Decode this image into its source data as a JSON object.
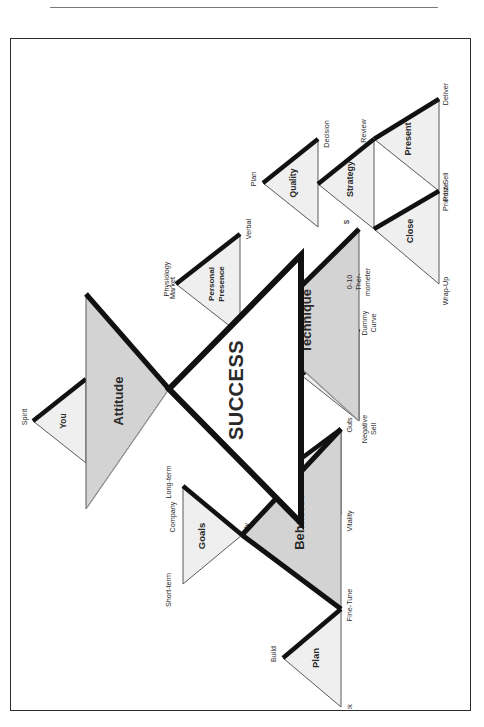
{
  "page": {
    "header_rule": true,
    "frame": {
      "border_color": "#2b2b2b"
    }
  },
  "diagram": {
    "title": "SUCCESS",
    "orientation": "rotated-90-clockwise",
    "fill_light": "#e3e3e3",
    "fill_white": "#ffffff",
    "stroke_dark": "#1a1a1a",
    "stroke_thin": "#4a4a4a",
    "center": {
      "label": "SUCCESS",
      "name": "success-core-triangle"
    },
    "pillars": [
      {
        "id": "attitude",
        "label": "Attitude",
        "corners": [
          "Market",
          "Company"
        ],
        "children": [
          {
            "id": "you",
            "label": "You",
            "corners": [
              "Body",
              "Mind"
            ],
            "grandchildren": [
              "Spirit"
            ]
          }
        ]
      },
      {
        "id": "technique",
        "label": "Technique",
        "corners": [
          "$",
          "0-10 Ther-mometer"
        ],
        "children": [
          {
            "id": "personal-presence",
            "label": "Personal Presence",
            "corners": [
              "Physiology",
              "Verbal",
              "Tonal-ity"
            ]
          },
          {
            "id": "quality",
            "label": "Quality",
            "corners": [
              "Plan",
              "Decision"
            ]
          },
          {
            "id": "strategy",
            "label": "Strategy",
            "corners": [
              "Review"
            ]
          },
          {
            "id": "present",
            "label": "Present",
            "corners": [
              "Deliver",
              "Prioritize"
            ]
          },
          {
            "id": "close",
            "label": "Close",
            "corners": [
              "Post-Sell",
              "Wrap-Up"
            ]
          },
          {
            "id": "tactics",
            "label": "Tactics",
            "corners": [
              "Reversing",
              "Dummy Curve",
              "Negative Sell"
            ]
          }
        ]
      },
      {
        "id": "behavior",
        "label": "Behavior",
        "corners": [
          "Discipline",
          "Build"
        ],
        "children": [
          {
            "id": "goals",
            "label": "Goals",
            "corners": [
              "Long-term",
              "Short-term",
              "Daily"
            ]
          },
          {
            "id": "action",
            "label": "Action",
            "corners": [
              "Guts",
              "Vitality"
            ]
          },
          {
            "id": "plan",
            "label": "Plan",
            "corners": [
              "Fine-Tune",
              "Track"
            ]
          }
        ]
      }
    ],
    "labels": {
      "success": "SUCCESS",
      "attitude": "Attitude",
      "technique": "Technique",
      "behavior": "Behavior",
      "you": "You",
      "spirit": "Spirit",
      "body": "Body",
      "mind": "Mind",
      "market": "Market",
      "company": "Company",
      "personal_presence_l1": "Personal",
      "personal_presence_l2": "Presence",
      "physiology": "Physiology",
      "verbal": "Verbal",
      "tonal_l1": "Tonal-",
      "tonal_l2": "ity",
      "quality": "Quality",
      "plan_top": "Plan",
      "decision": "Decision",
      "strategy": "Strategy",
      "review": "Review",
      "present": "Present",
      "deliver": "Deliver",
      "prioritize": "Prioritize",
      "close": "Close",
      "post_sell": "Post-Sell",
      "wrap_up": "Wrap-Up",
      "dollar": "$",
      "thermo_l1": "0-10",
      "thermo_l2": "Ther-",
      "thermo_l3": "mometer",
      "tactics": "Tactics",
      "reversing": "Reversing",
      "dummy_l1": "Dummy",
      "dummy_l2": "Curve",
      "negative_l1": "Negative",
      "negative_l2": "Sell",
      "goals": "Goals",
      "long_term": "Long-term",
      "short_term": "Short-term",
      "daily": "Daily",
      "discipline": "Discipline",
      "action": "Action",
      "guts": "Guts",
      "vitality": "Vitality",
      "build": "Build",
      "plan_bottom": "Plan",
      "fine_tune": "Fine-Tune",
      "track": "Track"
    }
  }
}
